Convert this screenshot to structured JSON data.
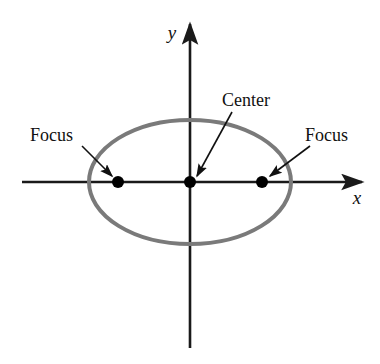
{
  "figure": {
    "kind": "ellipse-conic-section-diagram",
    "background_color": "#ffffff"
  },
  "axes": {
    "x_label": "x",
    "y_label": "y",
    "axis_color": "#1a1a1a",
    "x_axis": {
      "x_start": 22,
      "x_end": 362,
      "y": 182
    },
    "y_axis": {
      "x": 190,
      "y_start": 24,
      "y_end": 348
    }
  },
  "ellipse": {
    "center_x": 190,
    "center_y": 182,
    "semi_major_axis": 101,
    "semi_minor_axis": 62,
    "stroke_color": "#7a7a7a",
    "stroke_width": 4
  },
  "points": [
    {
      "name": "left-focus",
      "x": 118,
      "y": 182,
      "radius": 6,
      "color": "#000000"
    },
    {
      "name": "center",
      "x": 190,
      "y": 182,
      "radius": 6,
      "color": "#000000"
    },
    {
      "name": "right-focus",
      "x": 262,
      "y": 182,
      "radius": 6,
      "color": "#000000"
    }
  ],
  "annotations": {
    "focus_left": {
      "label": "Focus",
      "text_x": 30,
      "text_y": 141,
      "arrow_from_x": 82,
      "arrow_from_y": 146,
      "arrow_to_x": 112,
      "arrow_to_y": 176
    },
    "center": {
      "label": "Center",
      "text_x": 222,
      "text_y": 106,
      "arrow_from_x": 232,
      "arrow_from_y": 112,
      "arrow_to_x": 197,
      "arrow_to_y": 176
    },
    "focus_right": {
      "label": "Focus",
      "text_x": 305,
      "text_y": 141,
      "arrow_from_x": 310,
      "arrow_from_y": 146,
      "arrow_to_x": 270,
      "arrow_to_y": 176
    }
  }
}
